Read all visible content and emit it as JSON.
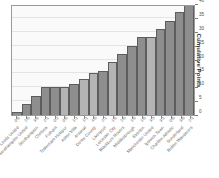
{
  "chart_data": {
    "type": "bar",
    "title": "",
    "subtitle": "",
    "xlabel": "",
    "ylabel": "Cumulative Points",
    "ylim": [
      0,
      40
    ],
    "yticks": [
      0,
      5,
      10,
      15,
      20,
      25,
      30,
      35,
      40
    ],
    "grid": true,
    "legend": "none",
    "orientation": "vertical",
    "y_axis_position": "right",
    "x_tick_label_rotation": -45,
    "categories": [
      "Leeds United",
      "Southampton United",
      "Southampton",
      "Chelsea",
      "Fulham",
      "Tottenham Hotspur",
      "Aston Villa",
      "Arsenal",
      "Derby County",
      "Liverpool",
      "Leicester City",
      "Blackburn Rovers",
      "Middlesbrough",
      "Everton",
      "Manchester United",
      "Ipswich Town",
      "Charlton Athletic",
      "Sunderland",
      "Bolton Wanderers"
    ],
    "x_tick_values": [
      "0-0",
      "2-0",
      "3-0",
      "2-1",
      "0-2",
      "0-0",
      "1-1",
      "1-1",
      "4-0",
      "2-1",
      "1-0",
      "2-0",
      "1-0",
      "1-0",
      "3-3",
      "3-1",
      "0-0",
      "3-0",
      "2-1"
    ],
    "values": [
      1,
      4,
      7,
      10,
      10,
      10,
      11,
      13,
      15,
      16,
      19,
      22,
      25,
      28,
      28,
      31,
      34,
      37,
      40
    ],
    "highlighted": [
      false,
      false,
      false,
      false,
      false,
      true,
      false,
      true,
      true,
      false,
      true,
      false,
      false,
      false,
      true,
      false,
      false,
      false,
      false
    ],
    "colors": {
      "bar": "#8e8e8e",
      "bar_highlight": "#b4b4b4",
      "bar_edge": "#5d5d5d",
      "plot_background": "#fafafa",
      "grid": "#e4e4e4",
      "axis": "#9a9a9a",
      "text": "#4f4f4f"
    }
  }
}
